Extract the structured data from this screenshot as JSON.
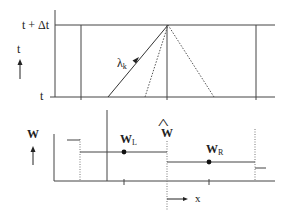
{
  "top_panel": {
    "t_upper_label": "t + Δt",
    "t_lower_label": "t",
    "axis_label": "t",
    "lambda_label": "λ",
    "lambda_sub": "k"
  },
  "bottom_panel": {
    "axis_label": "W",
    "wl_label": "W",
    "wl_sub": "L",
    "wr_label": "W",
    "wr_sub": "R",
    "what_label": "W",
    "what_hat": "^",
    "x_label": "x"
  },
  "colors": {
    "line": "#333333",
    "dotted": "#666666",
    "text": "#222222",
    "background": "#ffffff"
  }
}
